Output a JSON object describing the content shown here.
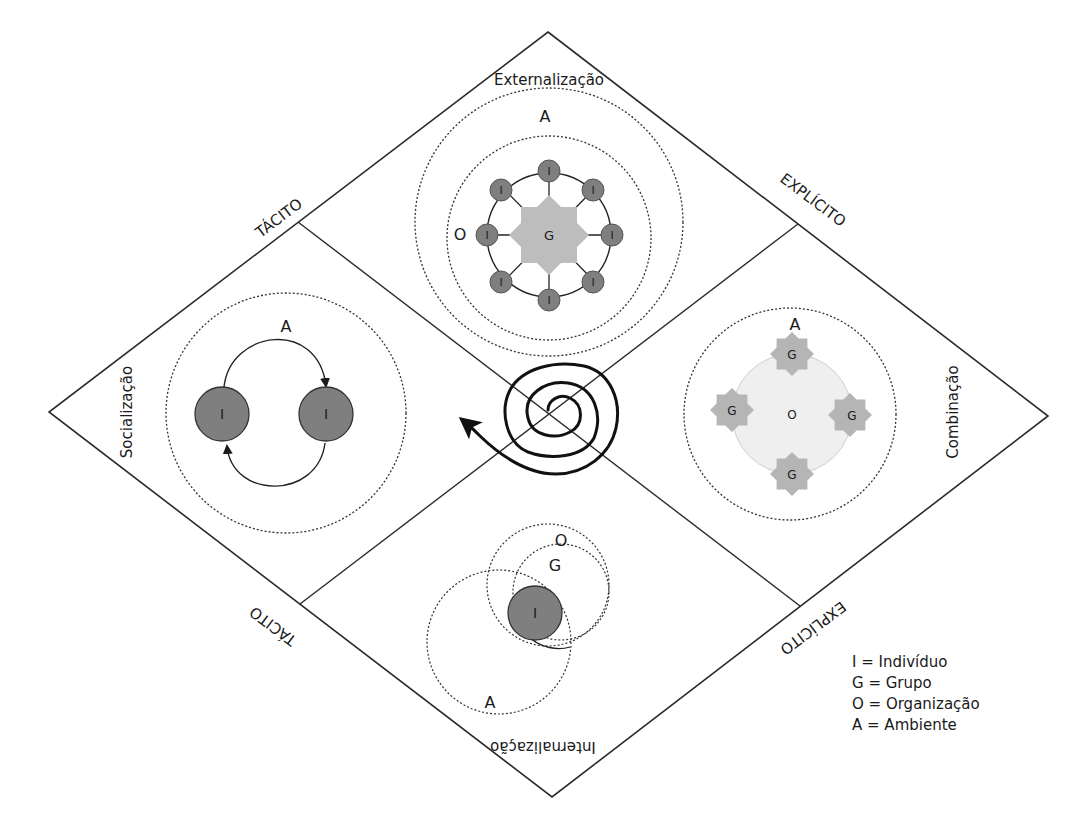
{
  "diagram": {
    "axes": {
      "top_left": "TÁCITO",
      "top_right": "EXPLÍCITO",
      "bottom_left": "TÁCITO",
      "bottom_right": "EXPLÍCITO"
    },
    "quadrants": {
      "top": {
        "name": "Externalização",
        "label_A": "A",
        "label_O": "O",
        "center_label": "G",
        "node_label": "I"
      },
      "left": {
        "name": "Socialização",
        "label_A": "A",
        "node_label": "I"
      },
      "right": {
        "name": "Combinação",
        "label_A": "A",
        "center_label": "O",
        "group_label": "G"
      },
      "bottom": {
        "name": "Internalização",
        "label_O": "O",
        "label_G": "G",
        "label_A": "A",
        "node_label": "I"
      }
    },
    "legend": [
      "I = Indivíduo",
      "G = Grupo",
      "O = Organização",
      "A = Ambiente"
    ],
    "colors": {
      "line": "#2a2a2a",
      "node_fill": "#7f7f7f",
      "group_fill": "#b9b9b9",
      "org_fill": "#eeeeee"
    }
  }
}
